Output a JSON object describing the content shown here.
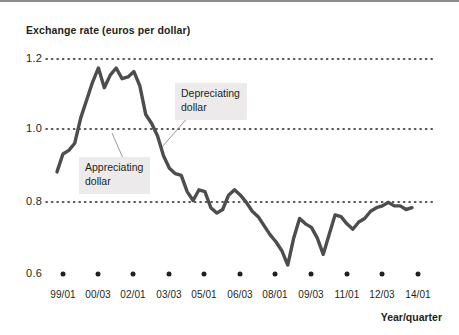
{
  "chart_data": {
    "type": "line",
    "title": "Exchange rate (euros per dollar)",
    "xlabel": "Year/quarter",
    "ylabel": "Exchange rate (euros per dollar)",
    "ylim": [
      0.6,
      1.2
    ],
    "yticks": [
      "1.2",
      "1.0",
      "0.8",
      "0.6"
    ],
    "ytick_values": [
      1.2,
      1.0,
      0.8,
      0.6
    ],
    "xticks": [
      "99/01",
      "00/03",
      "02/01",
      "03/03",
      "05/01",
      "06/03",
      "08/01",
      "09/03",
      "11/01",
      "12/03",
      "14/01"
    ],
    "grid": "horizontal-dotted",
    "legend": "none",
    "line_color": "#4d4d4d",
    "grid_color": "#231f20",
    "series": [
      {
        "name": "Exchange rate (euros per dollar)",
        "x": [
          "99/01",
          "99/02",
          "99/03",
          "99/04",
          "00/01",
          "00/02",
          "00/03",
          "00/04",
          "01/01",
          "01/02",
          "01/03",
          "01/04",
          "02/01",
          "02/02",
          "02/03",
          "02/04",
          "03/01",
          "03/02",
          "03/03",
          "03/04",
          "04/01",
          "04/02",
          "04/03",
          "04/04",
          "05/01",
          "05/02",
          "05/03",
          "05/04",
          "06/01",
          "06/02",
          "06/03",
          "06/04",
          "07/01",
          "07/02",
          "07/03",
          "07/04",
          "08/01",
          "08/02",
          "08/03",
          "08/04",
          "09/01",
          "09/02",
          "09/03",
          "09/04",
          "10/01",
          "10/02",
          "10/03",
          "10/04",
          "11/01",
          "11/02",
          "11/03",
          "11/04",
          "12/01",
          "12/02",
          "12/03",
          "12/04",
          "13/01",
          "13/02",
          "13/03",
          "13/04",
          "14/01"
        ],
        "values": [
          0.885,
          0.935,
          0.945,
          0.965,
          1.035,
          1.085,
          1.135,
          1.175,
          1.12,
          1.155,
          1.175,
          1.145,
          1.15,
          1.165,
          1.125,
          1.045,
          1.02,
          0.985,
          0.93,
          0.895,
          0.88,
          0.875,
          0.83,
          0.805,
          0.835,
          0.83,
          0.785,
          0.77,
          0.78,
          0.82,
          0.835,
          0.82,
          0.8,
          0.775,
          0.76,
          0.735,
          0.71,
          0.69,
          0.665,
          0.625,
          0.7,
          0.755,
          0.74,
          0.73,
          0.7,
          0.655,
          0.71,
          0.765,
          0.76,
          0.74,
          0.725,
          0.745,
          0.755,
          0.775,
          0.785,
          0.79,
          0.8,
          0.79,
          0.79,
          0.78,
          0.785
        ]
      }
    ],
    "annotations": [
      {
        "id": "appreciating",
        "text_line1": "Appreciating",
        "text_line2": "dollar"
      },
      {
        "id": "depreciating",
        "text_line1": "Depreciating",
        "text_line2": "dollar"
      }
    ]
  },
  "axes": {
    "y_labels": [
      {
        "text": "1.2",
        "top": 50
      },
      {
        "text": "1.0",
        "top": 120
      },
      {
        "text": "0.8",
        "top": 193
      },
      {
        "text": "0.6",
        "top": 265
      }
    ],
    "x_labels": [
      {
        "text": "99/01",
        "left": 43
      },
      {
        "text": "00/03",
        "left": 78
      },
      {
        "text": "02/01",
        "left": 113
      },
      {
        "text": "03/03",
        "left": 149
      },
      {
        "text": "05/01",
        "left": 184
      },
      {
        "text": "06/03",
        "left": 220
      },
      {
        "text": "08/01",
        "left": 255
      },
      {
        "text": "09/03",
        "left": 291
      },
      {
        "text": "11/01",
        "left": 327
      },
      {
        "text": "12/03",
        "left": 362
      },
      {
        "text": "14/01",
        "left": 398
      }
    ]
  }
}
